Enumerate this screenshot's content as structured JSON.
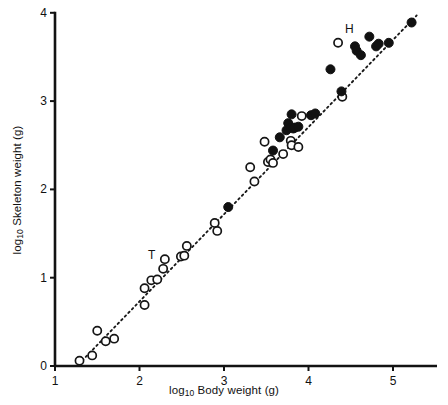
{
  "chart_data": {
    "type": "scatter",
    "title": "",
    "xlabel": "log10 Body weight (g)",
    "ylabel": "log10 Skeleton weight (g)",
    "xlabel_parts": {
      "prefix": "log",
      "sub": "10",
      "rest": " Body weight (g)"
    },
    "ylabel_parts": {
      "prefix": "log",
      "sub": "10",
      "rest": " Skeleton weight (g)"
    },
    "xlim": [
      1,
      5.5
    ],
    "ylim": [
      0,
      4
    ],
    "xticks": [
      1,
      2,
      3,
      4,
      5
    ],
    "yticks": [
      0,
      1,
      2,
      3,
      4
    ],
    "xtick_labels": [
      "1",
      "2",
      "3",
      "4",
      "5"
    ],
    "ytick_labels": [
      "0",
      "1",
      "2",
      "3",
      "4"
    ],
    "grid": false,
    "legend": "none",
    "annotations": [
      {
        "text": "T",
        "x": 2.22,
        "y": 1.26,
        "note": "label for point T"
      },
      {
        "text": "H",
        "x": 4.55,
        "y": 3.82,
        "note": "label for point H"
      }
    ],
    "fit_line": {
      "style": "dotted",
      "x": [
        1.28,
        5.28
      ],
      "y": [
        0.02,
        3.97
      ]
    },
    "series": [
      {
        "name": "open circles",
        "marker": "open-circle",
        "points": [
          [
            1.29,
            0.06
          ],
          [
            1.44,
            0.12
          ],
          [
            1.5,
            0.4
          ],
          [
            1.6,
            0.28
          ],
          [
            1.7,
            0.31
          ],
          [
            2.06,
            0.69
          ],
          [
            2.06,
            0.88
          ],
          [
            2.14,
            0.97
          ],
          [
            2.21,
            0.98
          ],
          [
            2.28,
            1.1
          ],
          [
            2.3,
            1.21
          ],
          [
            2.49,
            1.24
          ],
          [
            2.53,
            1.25
          ],
          [
            2.56,
            1.36
          ],
          [
            2.89,
            1.62
          ],
          [
            2.92,
            1.53
          ],
          [
            3.31,
            2.25
          ],
          [
            3.36,
            2.09
          ],
          [
            3.48,
            2.54
          ],
          [
            3.52,
            2.31
          ],
          [
            3.55,
            2.34
          ],
          [
            3.58,
            2.3
          ],
          [
            3.7,
            2.4
          ],
          [
            3.79,
            2.55
          ],
          [
            3.8,
            2.5
          ],
          [
            3.88,
            2.48
          ],
          [
            3.92,
            2.83
          ],
          [
            4.35,
            3.66
          ],
          [
            4.4,
            3.05
          ]
        ]
      },
      {
        "name": "filled circles",
        "marker": "filled-circle",
        "points": [
          [
            3.05,
            1.8
          ],
          [
            3.58,
            2.44
          ],
          [
            3.66,
            2.59
          ],
          [
            3.74,
            2.67
          ],
          [
            3.76,
            2.75
          ],
          [
            3.79,
            2.7
          ],
          [
            3.8,
            2.85
          ],
          [
            3.82,
            2.69
          ],
          [
            3.84,
            2.7
          ],
          [
            3.88,
            2.71
          ],
          [
            4.03,
            2.84
          ],
          [
            4.08,
            2.86
          ],
          [
            4.39,
            3.11
          ],
          [
            4.26,
            3.36
          ],
          [
            4.55,
            3.62
          ],
          [
            4.57,
            3.57
          ],
          [
            4.62,
            3.52
          ],
          [
            4.72,
            3.73
          ],
          [
            4.8,
            3.62
          ],
          [
            4.83,
            3.65
          ],
          [
            4.95,
            3.66
          ],
          [
            5.22,
            3.89
          ]
        ]
      }
    ]
  },
  "colors": {
    "axis": "#121212",
    "filled_marker": "#111111",
    "open_marker_stroke": "#151515",
    "open_marker_fill": "#ffffff",
    "fit_line": "#1a1a1a",
    "background": "#ffffff"
  }
}
